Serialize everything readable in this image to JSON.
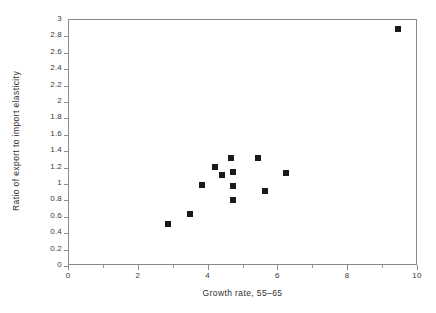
{
  "chart_data": {
    "type": "scatter",
    "title": "",
    "xlabel": "Growth rate, 55–65",
    "ylabel": "Ratio of export to import elasticity",
    "xlim": [
      0,
      10
    ],
    "ylim": [
      0,
      3
    ],
    "grid": false,
    "legend": null,
    "marker": "filled-square",
    "marker_color": "#1a1a1a",
    "x_major_ticks": [
      0,
      2,
      4,
      6,
      8,
      10
    ],
    "x_minor_ticks": [
      1,
      3,
      5,
      7,
      9
    ],
    "x_tick_labels": [
      "0",
      "2",
      "4",
      "6",
      "8",
      "10"
    ],
    "y_ticks": [
      0,
      0.2,
      0.4,
      0.6,
      0.8,
      1,
      1.2,
      1.4,
      1.6,
      1.8,
      2,
      2.2,
      2.4,
      2.6,
      2.8,
      3
    ],
    "y_tick_labels": [
      "0",
      "0.2",
      "0.4",
      "0.6",
      "0.8",
      "1",
      "1.2",
      "1.4",
      "1.6",
      "1.8",
      "2",
      "2.2",
      "2.4",
      "2.6",
      "2.8",
      "3"
    ],
    "points": [
      {
        "x": 2.84,
        "y": 0.51
      },
      {
        "x": 3.47,
        "y": 0.63
      },
      {
        "x": 3.81,
        "y": 0.99
      },
      {
        "x": 4.18,
        "y": 1.21
      },
      {
        "x": 4.38,
        "y": 1.11
      },
      {
        "x": 4.64,
        "y": 1.32
      },
      {
        "x": 4.7,
        "y": 1.15
      },
      {
        "x": 4.7,
        "y": 0.98
      },
      {
        "x": 4.7,
        "y": 0.8
      },
      {
        "x": 5.41,
        "y": 1.32
      },
      {
        "x": 5.62,
        "y": 0.91
      },
      {
        "x": 6.22,
        "y": 1.13
      },
      {
        "x": 9.43,
        "y": 2.89
      }
    ]
  },
  "axes": {
    "frame_color": "#8a8a8a",
    "text_color": "#3a3a3a"
  }
}
